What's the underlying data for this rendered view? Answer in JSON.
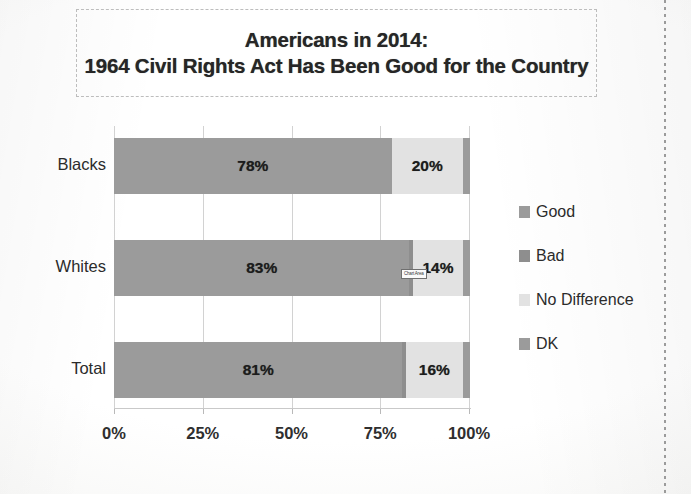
{
  "title": {
    "line1": "Americans in 2014:",
    "line2": "1964 Civil Rights Act Has Been Good for the Country"
  },
  "annotation": {
    "tooltip_text": "Chart Area"
  },
  "legend": {
    "items": [
      {
        "label": "Good",
        "color": "#9b9b9b"
      },
      {
        "label": "Bad",
        "color": "#8e8e8e"
      },
      {
        "label": "No Difference",
        "color": "#e2e2e2"
      },
      {
        "label": "DK",
        "color": "#9b9b9b"
      }
    ]
  },
  "axis": {
    "ticks": [
      "0%",
      "25%",
      "50%",
      "75%",
      "100%"
    ]
  },
  "categories": [
    "Blacks",
    "Whites",
    "Total"
  ],
  "bars": [
    {
      "category": "Blacks",
      "segments": [
        {
          "series": "Good",
          "value": 78,
          "label": "78%",
          "show_label": true
        },
        {
          "series": "Bad",
          "value": 0,
          "label": "",
          "show_label": false
        },
        {
          "series": "No Difference",
          "value": 20,
          "label": "20%",
          "show_label": true
        },
        {
          "series": "DK",
          "value": 2,
          "label": "",
          "show_label": false
        }
      ]
    },
    {
      "category": "Whites",
      "segments": [
        {
          "series": "Good",
          "value": 83,
          "label": "83%",
          "show_label": true
        },
        {
          "series": "Bad",
          "value": 1,
          "label": "",
          "show_label": false
        },
        {
          "series": "No Difference",
          "value": 14,
          "label": "14%",
          "show_label": true
        },
        {
          "series": "DK",
          "value": 2,
          "label": "",
          "show_label": false
        }
      ]
    },
    {
      "category": "Total",
      "segments": [
        {
          "series": "Good",
          "value": 81,
          "label": "81%",
          "show_label": true
        },
        {
          "series": "Bad",
          "value": 1,
          "label": "",
          "show_label": false
        },
        {
          "series": "No Difference",
          "value": 16,
          "label": "16%",
          "show_label": true
        },
        {
          "series": "DK",
          "value": 2,
          "label": "",
          "show_label": false
        }
      ]
    }
  ],
  "chart_data": {
    "type": "bar",
    "orientation": "horizontal",
    "stacked": true,
    "title": "Americans in 2014: 1964 Civil Rights Act Has Been Good for the Country",
    "xlabel": "",
    "ylabel": "",
    "xlim": [
      0,
      100
    ],
    "xticks": [
      0,
      25,
      50,
      75,
      100
    ],
    "xticklabels": [
      "0%",
      "25%",
      "50%",
      "75%",
      "100%"
    ],
    "grid": true,
    "legend_position": "right",
    "categories": [
      "Blacks",
      "Whites",
      "Total"
    ],
    "series": [
      {
        "name": "Good",
        "color": "#9b9b9b",
        "values": [
          78,
          83,
          81
        ],
        "labels": [
          "78%",
          "83%",
          "81%"
        ]
      },
      {
        "name": "Bad",
        "color": "#8e8e8e",
        "values": [
          0,
          1,
          1
        ],
        "labels": [
          "",
          "",
          ""
        ]
      },
      {
        "name": "No Difference",
        "color": "#e2e2e2",
        "values": [
          20,
          14,
          16
        ],
        "labels": [
          "20%",
          "14%",
          "16%"
        ]
      },
      {
        "name": "DK",
        "color": "#9b9b9b",
        "values": [
          2,
          2,
          2
        ],
        "labels": [
          "",
          "",
          ""
        ]
      }
    ],
    "annotations": [
      "Chart Area"
    ]
  }
}
